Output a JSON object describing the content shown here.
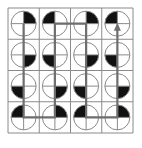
{
  "diagram": {
    "type": "grid-puzzle",
    "rows": 4,
    "cols": 4,
    "grid_origin": [
      8,
      8
    ],
    "cell_size": 31.25,
    "colors": {
      "grid_line": "#8a8a8a",
      "circle_stroke": "#8a8a8a",
      "quadrant_fill": "#111111",
      "path": "#6e6e6e",
      "background": "#ffffff"
    },
    "cells": [
      [
        "top-right",
        "top-left",
        "top-right",
        "top-left"
      ],
      [
        "bottom-right",
        "bottom-left",
        "bottom-right",
        "bottom-left"
      ],
      [
        "bottom-left",
        "bottom-right",
        "bottom-left",
        "bottom-right"
      ],
      [
        "top-left",
        "top-right",
        "top-left",
        "top-right"
      ]
    ],
    "path": {
      "description": "Serpentine path: down column 1, up column 2, down column 3, up column 4 ending with arrow",
      "points": [
        [
          0,
          0
        ],
        [
          0,
          3
        ],
        [
          1,
          3
        ],
        [
          1,
          0
        ],
        [
          2,
          0
        ],
        [
          2,
          3
        ],
        [
          3,
          3
        ],
        [
          3,
          0
        ]
      ],
      "arrow_end": "up"
    }
  }
}
